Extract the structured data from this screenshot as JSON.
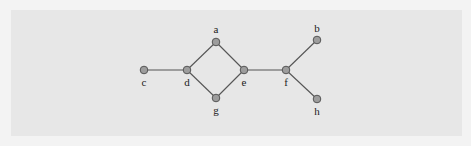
{
  "diagram": {
    "type": "undirected-graph",
    "colors": {
      "background": "#f3f3f3",
      "panel": "#e7e7e7",
      "node_fill": "#9d9d9d",
      "node_stroke": "#555555",
      "edge": "#555555",
      "label": "#222222"
    },
    "nodes": [
      {
        "id": "a",
        "label": "a",
        "x": 216,
        "y": 42,
        "label_pos": "above"
      },
      {
        "id": "b",
        "label": "b",
        "x": 317,
        "y": 40,
        "label_pos": "above"
      },
      {
        "id": "c",
        "label": "c",
        "x": 144,
        "y": 70,
        "label_pos": "below"
      },
      {
        "id": "d",
        "label": "d",
        "x": 187,
        "y": 70,
        "label_pos": "below"
      },
      {
        "id": "e",
        "label": "e",
        "x": 244,
        "y": 70,
        "label_pos": "below"
      },
      {
        "id": "f",
        "label": "f",
        "x": 286,
        "y": 70,
        "label_pos": "below"
      },
      {
        "id": "g",
        "label": "g",
        "x": 216,
        "y": 98,
        "label_pos": "below"
      },
      {
        "id": "h",
        "label": "h",
        "x": 317,
        "y": 99,
        "label_pos": "below"
      }
    ],
    "edges": [
      [
        "c",
        "d"
      ],
      [
        "d",
        "a"
      ],
      [
        "d",
        "g"
      ],
      [
        "a",
        "e"
      ],
      [
        "g",
        "e"
      ],
      [
        "e",
        "f"
      ],
      [
        "f",
        "b"
      ],
      [
        "f",
        "h"
      ]
    ]
  }
}
